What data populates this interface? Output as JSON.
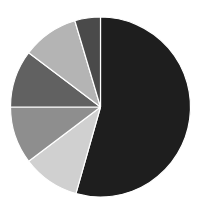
{
  "chart_data": {
    "type": "pie",
    "title": "",
    "legend": [],
    "start_angle_deg": 0,
    "direction": "clockwise",
    "categories": [
      "Slice 1",
      "Slice 2",
      "Slice 3",
      "Slice 4",
      "Slice 5",
      "Slice 6"
    ],
    "values": [
      54.4,
      10.3,
      10.3,
      10.3,
      10.1,
      4.6
    ],
    "colors": [
      "#1e1e1e",
      "#d0d0d0",
      "#8e8e8e",
      "#616161",
      "#b4b4b4",
      "#4a4a4a"
    ],
    "labels_visible": false
  },
  "layout": {
    "center_x": 100.5,
    "center_y": 107,
    "radius": 90,
    "background": "#ffffff",
    "separator_color": "#ffffff"
  }
}
